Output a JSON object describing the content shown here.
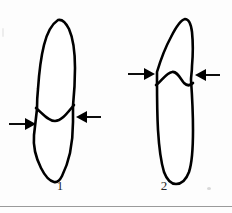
{
  "figure": {
    "background_color": "#fdfdfd",
    "ink_color": "#000000",
    "rule_color": "#9a9a9a",
    "panels": [
      {
        "id": "panel-1",
        "label": "1",
        "description": "Tooth with pointed conical crown and tapering root; cervical line marked by two opposing horizontal arrows at mid-height",
        "crown_shape": "pointed-conical",
        "cervical_line_shape": "concave-curve",
        "arrow_left_label": "",
        "arrow_right_label": ""
      },
      {
        "id": "panel-2",
        "label": "2",
        "description": "Tooth with asymmetric hooked crown and long parallel-sided root; cervical line marked by two opposing horizontal arrows in upper third",
        "crown_shape": "asymmetric-hooked",
        "cervical_line_shape": "wavy-peak",
        "arrow_left_label": "",
        "arrow_right_label": ""
      }
    ],
    "arrow_icon_name": "right-pointing-arrow",
    "arrow_icon_name_mirrored": "left-pointing-arrow"
  }
}
